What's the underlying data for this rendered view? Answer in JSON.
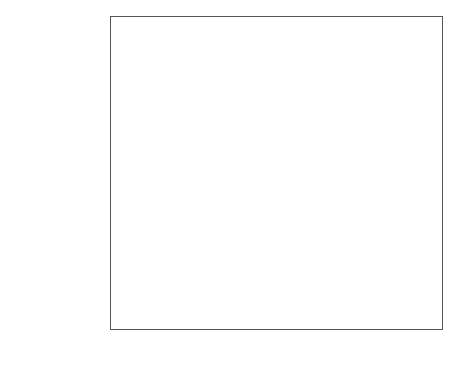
{
  "chart_data": {
    "type": "scatter",
    "title": "",
    "subtitle": "",
    "xlabel": "Comparison intervals",
    "ylabel": "",
    "xlim": [
      25,
      512
    ],
    "xticks": [
      50,
      100,
      150,
      200,
      250,
      300,
      350,
      400,
      450,
      500
    ],
    "xticklabels": [
      "50",
      "100",
      "150",
      "200",
      "250",
      "300",
      "350",
      "400",
      "450",
      "500"
    ],
    "grid": false,
    "legend": null,
    "orientation": "horizontal",
    "marker": "open-circle",
    "error_bar_style": "horizontal comparison interval line",
    "groups": [
      {
        "name": "Numbers",
        "items": [
          {
            "label": "2",
            "script": "latin",
            "value": 320,
            "low": 255,
            "high": 385,
            "highlight": false
          },
          {
            "label": "3",
            "script": "latin",
            "value": 296,
            "low": 235,
            "high": 360,
            "highlight": false
          },
          {
            "label": "6",
            "script": "latin",
            "value": 320,
            "low": 253,
            "high": 390,
            "highlight": false
          },
          {
            "label": "5",
            "script": "latin",
            "value": 320,
            "low": 252,
            "high": 392,
            "highlight": false
          },
          {
            "label": "٧",
            "script": "arabic",
            "value": 274,
            "low": 190,
            "high": 362,
            "highlight": false
          },
          {
            "label": "١",
            "script": "arabic",
            "value": 277,
            "low": 203,
            "high": 352,
            "highlight": false
          },
          {
            "label": "٩",
            "script": "arabic",
            "value": 286,
            "low": 213,
            "high": 360,
            "highlight": false
          },
          {
            "label": "٢",
            "script": "arabic",
            "value": 268,
            "low": 178,
            "high": 358,
            "highlight": false
          }
        ]
      },
      {
        "name": "Letters",
        "items": [
          {
            "label": "i",
            "script": "latin",
            "value": 290,
            "low": 203,
            "high": 375,
            "highlight": false
          },
          {
            "label": "s",
            "script": "latin",
            "value": 375,
            "low": 268,
            "high": 480,
            "highlight": true
          },
          {
            "label": "k",
            "script": "latin",
            "value": 307,
            "low": 230,
            "high": 385,
            "highlight": false
          },
          {
            "label": "p",
            "script": "latin",
            "value": 318,
            "low": 243,
            "high": 393,
            "highlight": false
          },
          {
            "label": "ل",
            "script": "arabic",
            "value": 316,
            "low": 238,
            "high": 394,
            "highlight": false
          },
          {
            "label": "ك",
            "script": "arabic",
            "value": 289,
            "low": 207,
            "high": 370,
            "highlight": false
          },
          {
            "label": "بـ",
            "script": "arabic",
            "value": 296,
            "low": 215,
            "high": 377,
            "highlight": false
          },
          {
            "label": "د",
            "script": "arabic",
            "value": 279,
            "low": 192,
            "high": 365,
            "highlight": false
          }
        ]
      },
      {
        "name": "Shapes",
        "items": [
          {
            "label": "Triangle",
            "script": "latin",
            "value": 283,
            "low": 205,
            "high": 360,
            "highlight": false
          },
          {
            "label": "Heart",
            "script": "latin",
            "value": 272,
            "low": 190,
            "high": 352,
            "highlight": false
          },
          {
            "label": "Sqaure",
            "script": "latin",
            "value": 244,
            "low": 150,
            "high": 338,
            "highlight": false
          },
          {
            "label": "Octagon",
            "script": "latin",
            "value": 272,
            "low": 193,
            "high": 352,
            "highlight": false
          },
          {
            "label": "Parallelogram",
            "script": "latin",
            "value": 214,
            "low": 123,
            "high": 305,
            "highlight": false
          },
          {
            "label": "Arrow",
            "script": "latin",
            "value": 181,
            "low": 105,
            "high": 298,
            "highlight": true
          },
          {
            "label": "Half circle",
            "script": "latin",
            "value": 210,
            "low": 140,
            "high": 290,
            "highlight": false
          },
          {
            "label": "Star",
            "script": "latin",
            "value": 179,
            "low": 105,
            "high": 297,
            "highlight": true
          }
        ]
      },
      {
        "name": "Emoticons",
        "items": [
          {
            "label": "Happy",
            "script": "latin",
            "value": 295,
            "low": 225,
            "high": 365,
            "highlight": false
          },
          {
            "label": "Disappointed",
            "script": "latin",
            "value": 268,
            "low": 190,
            "high": 342,
            "highlight": false
          },
          {
            "label": "Funny",
            "script": "latin",
            "value": 240,
            "low": 148,
            "high": 330,
            "highlight": false
          },
          {
            "label": "Guilty",
            "script": "latin",
            "value": 260,
            "low": 178,
            "high": 343,
            "highlight": false
          },
          {
            "label": "Worried",
            "script": "latin",
            "value": 250,
            "low": 168,
            "high": 335,
            "highlight": false
          },
          {
            "label": "Relaxed",
            "script": "latin",
            "value": 247,
            "low": 160,
            "high": 332,
            "highlight": false
          },
          {
            "label": "Glad",
            "script": "latin",
            "value": 240,
            "low": 160,
            "high": 325,
            "highlight": false
          },
          {
            "label": "Sad",
            "script": "latin",
            "value": 236,
            "low": 170,
            "high": 320,
            "highlight": false
          }
        ]
      }
    ],
    "annotations": [
      {
        "kind": "bar-marker",
        "name": "letter-s-marker",
        "row_label": "s",
        "x": 405
      },
      {
        "kind": "arrow-glyph",
        "name": "arrow-shape-icon",
        "row_label": "Arrow",
        "x": 305
      },
      {
        "kind": "star-glyph",
        "name": "star-shape-icon",
        "row_label": "Star",
        "x": 305
      }
    ]
  },
  "colors": {
    "axis": "#555555",
    "interval_line": "#b9b9b9",
    "interval_line_highlight": "#4a4a4a",
    "marker_edge": "#9a9a9a",
    "marker_edge_highlight": "#2b2b2b",
    "text": "#222222",
    "separator": "#7d7d7d",
    "background": "#ffffff"
  }
}
